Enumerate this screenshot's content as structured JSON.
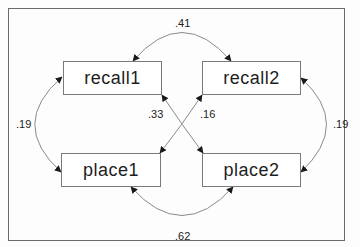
{
  "diagram": {
    "type": "path-diagram",
    "nodes": [
      {
        "id": "recall1",
        "label": "recall1"
      },
      {
        "id": "recall2",
        "label": "recall2"
      },
      {
        "id": "place1",
        "label": "place1"
      },
      {
        "id": "place2",
        "label": "place2"
      }
    ],
    "edges": [
      {
        "from": "recall1",
        "to": "recall2",
        "kind": "covariance",
        "label": ".41"
      },
      {
        "from": "recall1",
        "to": "place1",
        "kind": "covariance",
        "label": ".19"
      },
      {
        "from": "recall2",
        "to": "place2",
        "kind": "covariance",
        "label": ".19"
      },
      {
        "from": "place1",
        "to": "place2",
        "kind": "covariance",
        "label": ".62"
      },
      {
        "from": "recall1",
        "to": "place2",
        "kind": "covariance",
        "label": ".33"
      },
      {
        "from": "recall2",
        "to": "place1",
        "kind": "covariance",
        "label": ".16"
      }
    ],
    "colors": {
      "stroke": "#8a8a8a",
      "arrowhead": "#1a1a1a",
      "frame": "#6a6a6a",
      "text": "#1e1e1e"
    }
  }
}
